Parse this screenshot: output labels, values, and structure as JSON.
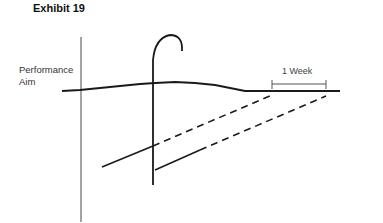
{
  "title": "Exhibit 19",
  "labels": {
    "performance_aim_line1": "Performance",
    "performance_aim_line2": "Aim",
    "interval": "1 Week"
  },
  "colors": {
    "line": "#1a1a1a",
    "axis": "#555555",
    "text": "#333333"
  }
}
